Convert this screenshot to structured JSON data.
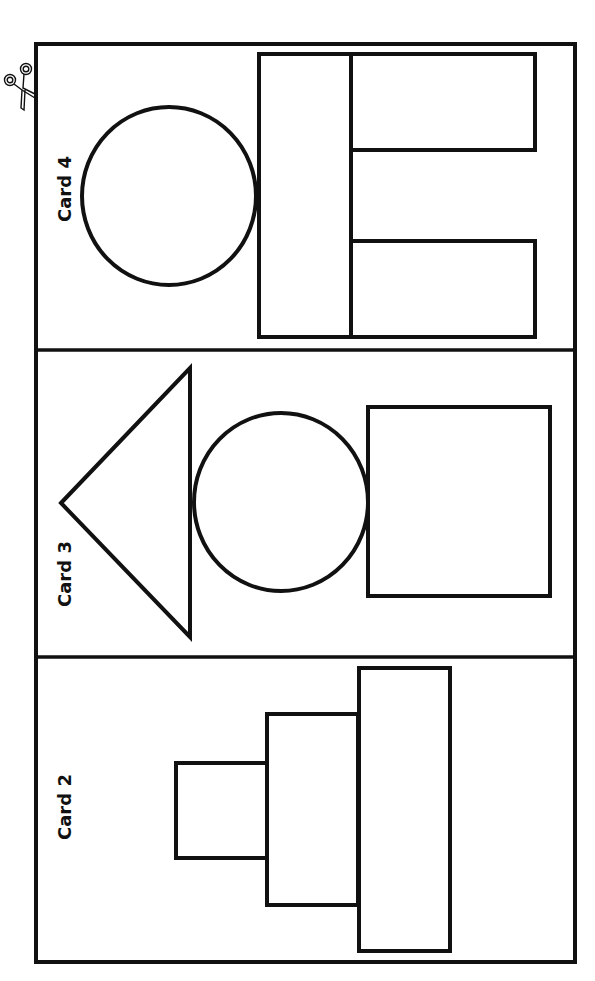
{
  "page": {
    "background": "#ffffff",
    "stroke_color": "#111111"
  },
  "frame": {
    "x": 36,
    "y": 44,
    "width": 539,
    "height": 918
  },
  "cut_marker": {
    "icon": "scissors-icon"
  },
  "cards": [
    {
      "id": "card-4",
      "label": "Card 4",
      "region": {
        "y_top": 44,
        "y_bottom": 350
      },
      "shapes": [
        {
          "type": "circle",
          "name": "head-circle",
          "cx": 169,
          "cy": 196,
          "rx": 87,
          "ry": 89
        },
        {
          "type": "rect",
          "name": "body-rect",
          "x": 259,
          "y": 54,
          "w": 92,
          "h": 283
        },
        {
          "type": "rect",
          "name": "upper-leg-rect",
          "x": 351,
          "y": 54,
          "w": 184,
          "h": 96
        },
        {
          "type": "rect",
          "name": "lower-leg-rect",
          "x": 351,
          "y": 241,
          "w": 184,
          "h": 96
        }
      ]
    },
    {
      "id": "card-3",
      "label": "Card 3",
      "region": {
        "y_top": 350,
        "y_bottom": 657
      },
      "shapes": [
        {
          "type": "triangle",
          "name": "hat-triangle",
          "points": "61,503 190,368 190,637"
        },
        {
          "type": "circle",
          "name": "head-circle",
          "cx": 281,
          "cy": 502,
          "rx": 87,
          "ry": 89
        },
        {
          "type": "rect",
          "name": "body-square",
          "x": 368,
          "y": 407,
          "w": 182,
          "h": 189
        }
      ]
    },
    {
      "id": "card-2",
      "label": "Card 2",
      "region": {
        "y_top": 657,
        "y_bottom": 962
      },
      "shapes": [
        {
          "type": "rect",
          "name": "small-rect",
          "x": 176,
          "y": 763,
          "w": 91,
          "h": 95
        },
        {
          "type": "rect",
          "name": "medium-rect",
          "x": 267,
          "y": 714,
          "w": 91,
          "h": 191
        },
        {
          "type": "rect",
          "name": "large-rect",
          "x": 359,
          "y": 668,
          "w": 91,
          "h": 283
        }
      ]
    }
  ]
}
